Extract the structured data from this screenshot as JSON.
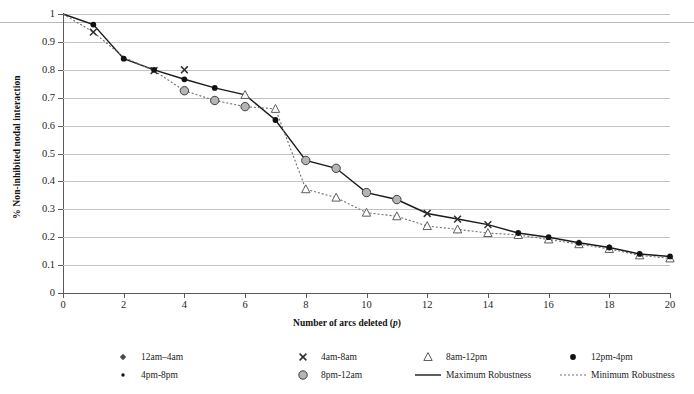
{
  "chart_data": {
    "type": "line",
    "title": "",
    "xlabel": "Number of arcs deleted (p)",
    "ylabel": "% Non-inhibited nodal interaction",
    "xlim": [
      0,
      20
    ],
    "ylim": [
      0,
      1
    ],
    "grid": "horizontal",
    "legend_position": "bottom",
    "x": [
      0,
      1,
      2,
      3,
      4,
      5,
      6,
      7,
      8,
      9,
      10,
      11,
      12,
      13,
      14,
      15,
      16,
      17,
      18,
      19,
      20
    ],
    "xticks": [
      "0",
      "2",
      "4",
      "6",
      "8",
      "10",
      "12",
      "14",
      "16",
      "18",
      "20"
    ],
    "yticks": [
      "0",
      "0.1",
      "0.2",
      "0.3",
      "0.4",
      "0.5",
      "0.6",
      "0.7",
      "0.8",
      "0.9",
      "1"
    ],
    "series": [
      {
        "name": "Maximum Robustness",
        "style": "solid",
        "color": "#1a1a1a",
        "values": [
          1.0,
          0.962,
          0.84,
          0.8,
          0.766,
          0.735,
          0.71,
          0.62,
          0.475,
          0.447,
          0.36,
          0.335,
          0.285,
          0.265,
          0.245,
          0.215,
          0.2,
          0.18,
          0.163,
          0.14,
          0.131
        ]
      },
      {
        "name": "Minimum Robustness",
        "style": "dotted",
        "color": "#6e6e6e",
        "values": [
          1.0,
          0.935,
          0.845,
          0.797,
          0.725,
          0.69,
          0.668,
          0.66,
          0.372,
          0.342,
          0.288,
          0.275,
          0.24,
          0.228,
          0.215,
          0.208,
          0.192,
          0.175,
          0.158,
          0.135,
          0.124
        ]
      }
    ],
    "marker_series": [
      {
        "name": "12am-4am",
        "marker": "diamond",
        "color": "#4a4a4a",
        "points": []
      },
      {
        "name": "4am-8am",
        "marker": "cross",
        "color": "#4a4a4a",
        "points": [
          {
            "x": 1,
            "y": 0.935
          },
          {
            "x": 3,
            "y": 0.797
          },
          {
            "x": 4,
            "y": 0.8
          },
          {
            "x": 12,
            "y": 0.285
          },
          {
            "x": 13,
            "y": 0.265
          },
          {
            "x": 14,
            "y": 0.245
          }
        ]
      },
      {
        "name": "8am-12pm",
        "marker": "triangle",
        "color": "#6e6e6e",
        "points": [
          {
            "x": 6,
            "y": 0.71
          },
          {
            "x": 7,
            "y": 0.66
          },
          {
            "x": 8,
            "y": 0.372
          },
          {
            "x": 9,
            "y": 0.342
          },
          {
            "x": 10,
            "y": 0.288
          },
          {
            "x": 11,
            "y": 0.275
          },
          {
            "x": 12,
            "y": 0.24
          },
          {
            "x": 13,
            "y": 0.228
          },
          {
            "x": 14,
            "y": 0.215
          },
          {
            "x": 15,
            "y": 0.208
          },
          {
            "x": 16,
            "y": 0.192
          },
          {
            "x": 17,
            "y": 0.175
          },
          {
            "x": 18,
            "y": 0.158
          },
          {
            "x": 19,
            "y": 0.135
          },
          {
            "x": 20,
            "y": 0.124
          }
        ]
      },
      {
        "name": "12pm-4pm",
        "marker": "circle-filled",
        "color": "#111111",
        "points": [
          {
            "x": 1,
            "y": 0.962
          },
          {
            "x": 2,
            "y": 0.84
          },
          {
            "x": 3,
            "y": 0.8
          },
          {
            "x": 4,
            "y": 0.766
          },
          {
            "x": 5,
            "y": 0.735
          },
          {
            "x": 7,
            "y": 0.62
          },
          {
            "x": 15,
            "y": 0.215
          },
          {
            "x": 16,
            "y": 0.2
          },
          {
            "x": 17,
            "y": 0.18
          },
          {
            "x": 18,
            "y": 0.163
          },
          {
            "x": 19,
            "y": 0.14
          },
          {
            "x": 20,
            "y": 0.131
          }
        ]
      },
      {
        "name": "4pm-8pm",
        "marker": "dot-small",
        "color": "#111111",
        "points": []
      },
      {
        "name": "8pm-12am",
        "marker": "circle-grey",
        "color": "#a8a8a8",
        "points": [
          {
            "x": 4,
            "y": 0.725
          },
          {
            "x": 5,
            "y": 0.69
          },
          {
            "x": 6,
            "y": 0.668
          },
          {
            "x": 8,
            "y": 0.475
          },
          {
            "x": 9,
            "y": 0.447
          },
          {
            "x": 10,
            "y": 0.36
          },
          {
            "x": 11,
            "y": 0.335
          }
        ]
      }
    ]
  },
  "axis": {
    "y_title": "% Non-inhibited nodal interaction",
    "x_title_main": "Number of arcs deleted (",
    "x_title_var": "p",
    "x_title_end": ")"
  },
  "legend": {
    "items": [
      {
        "label": "12am–4am",
        "marker": "diamond"
      },
      {
        "label": "4am-8am",
        "marker": "cross"
      },
      {
        "label": "8am-12pm",
        "marker": "triangle"
      },
      {
        "label": "12pm-4pm",
        "marker": "circle-filled"
      },
      {
        "label": "4pm-8pm",
        "marker": "dot-small"
      },
      {
        "label": "8pm-12am",
        "marker": "circle-grey"
      },
      {
        "label": "Maximum Robustness",
        "marker": "line-solid"
      },
      {
        "label": "Minimum Robustness",
        "marker": "line-dotted"
      }
    ]
  },
  "colors": {
    "axis": "#5a5a5a",
    "grid": "#c4c4c4",
    "max_line": "#1a1a1a",
    "min_line": "#6e6e6e",
    "marker_grey": "#a8a8a8"
  }
}
